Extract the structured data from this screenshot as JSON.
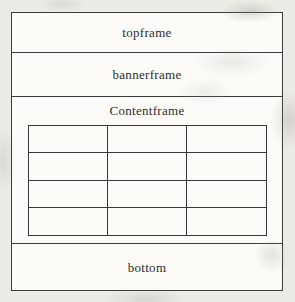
{
  "figure": {
    "type": "frameset-layout-diagram",
    "frames": [
      {
        "name": "topframe",
        "label": "topframe"
      },
      {
        "name": "bannerframe",
        "label": "bannerframe"
      },
      {
        "name": "contentframe",
        "label": "Contentframe"
      },
      {
        "name": "bottom",
        "label": "bottom"
      }
    ],
    "content_table": {
      "rows": 4,
      "columns": 3,
      "cells_empty": true
    },
    "colors": {
      "line": "#3b3b3b",
      "canvas_background": "#edebe6",
      "frame_background": "#fcfbf8",
      "text": "#2d2d2d"
    }
  }
}
